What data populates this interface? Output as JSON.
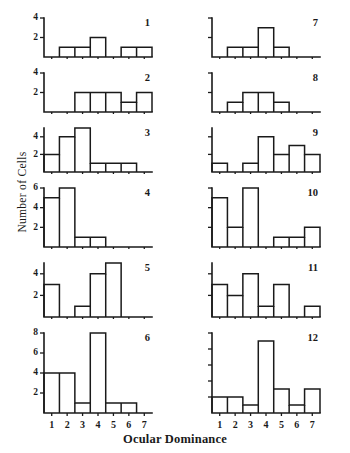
{
  "figure": {
    "xlabel": "Ocular Dominance",
    "ylabel": "Number of Cells",
    "x_tick_labels": [
      "1",
      "2",
      "3",
      "4",
      "5",
      "6",
      "7"
    ]
  },
  "chart_data": {
    "type": "bar",
    "title": "",
    "subtitle": "",
    "xlabel": "Ocular Dominance",
    "ylabel": "Number of Cells",
    "categories": [
      "1",
      "2",
      "3",
      "4",
      "5",
      "6",
      "7"
    ],
    "grid": false,
    "legend": "none",
    "layout": "2 columns x 6 rows of histogram panels",
    "panels": [
      {
        "label": "1",
        "column": "left",
        "row": 1,
        "values": [
          0,
          1,
          1,
          2,
          0,
          1,
          1
        ],
        "ylim": [
          0,
          4
        ],
        "yticks": [
          2,
          4
        ],
        "ytick_labels": [
          "2",
          "4"
        ]
      },
      {
        "label": "2",
        "column": "left",
        "row": 2,
        "values": [
          0,
          0,
          2,
          2,
          2,
          1,
          2
        ],
        "ylim": [
          0,
          4
        ],
        "yticks": [
          2,
          4
        ],
        "ytick_labels": [
          "2",
          "4"
        ]
      },
      {
        "label": "3",
        "column": "left",
        "row": 3,
        "values": [
          2,
          4,
          5,
          1,
          1,
          1,
          0
        ],
        "ylim": [
          0,
          5
        ],
        "yticks": [
          2,
          4
        ],
        "ytick_labels": [
          "2",
          "4"
        ]
      },
      {
        "label": "4",
        "column": "left",
        "row": 4,
        "values": [
          5,
          6,
          1,
          1,
          0,
          0,
          0
        ],
        "ylim": [
          0,
          6
        ],
        "yticks": [
          2,
          4,
          6
        ],
        "ytick_labels": [
          "2",
          "4",
          "6"
        ]
      },
      {
        "label": "5",
        "column": "left",
        "row": 5,
        "values": [
          3,
          0,
          1,
          4,
          5,
          0,
          0
        ],
        "ylim": [
          0,
          5
        ],
        "yticks": [
          2,
          4
        ],
        "ytick_labels": [
          "2",
          "4"
        ]
      },
      {
        "label": "6",
        "column": "left",
        "row": 6,
        "values": [
          4,
          4,
          1,
          8,
          1,
          1,
          0
        ],
        "ylim": [
          0,
          8
        ],
        "yticks": [
          2,
          4,
          6,
          8
        ],
        "ytick_labels": [
          "2",
          "4",
          "6",
          "8"
        ]
      },
      {
        "label": "7",
        "column": "right",
        "row": 1,
        "values": [
          0,
          1,
          1,
          3,
          1,
          0,
          0
        ],
        "ylim": [
          0,
          4
        ],
        "yticks": [
          2,
          4
        ],
        "ytick_labels": [
          "",
          ""
        ]
      },
      {
        "label": "8",
        "column": "right",
        "row": 2,
        "values": [
          0,
          1,
          2,
          2,
          1,
          0,
          0
        ],
        "ylim": [
          0,
          4
        ],
        "yticks": [
          2,
          4
        ],
        "ytick_labels": [
          "",
          ""
        ]
      },
      {
        "label": "9",
        "column": "right",
        "row": 3,
        "values": [
          1,
          0,
          1,
          4,
          2,
          3,
          2
        ],
        "ylim": [
          0,
          5
        ],
        "yticks": [
          2,
          4
        ],
        "ytick_labels": [
          "",
          ""
        ]
      },
      {
        "label": "10",
        "column": "right",
        "row": 4,
        "values": [
          5,
          2,
          6,
          0,
          1,
          1,
          2
        ],
        "ylim": [
          0,
          6
        ],
        "yticks": [
          2,
          4,
          6
        ],
        "ytick_labels": [
          "",
          "",
          ""
        ]
      },
      {
        "label": "11",
        "column": "right",
        "row": 5,
        "values": [
          3,
          2,
          4,
          1,
          3,
          0,
          1
        ],
        "ylim": [
          0,
          5
        ],
        "yticks": [
          2,
          4
        ],
        "ytick_labels": [
          "",
          ""
        ]
      },
      {
        "label": "12",
        "column": "right",
        "row": 6,
        "values": [
          2,
          2,
          1,
          9,
          3,
          1,
          3
        ],
        "ylim": [
          0,
          10
        ],
        "yticks": [
          2,
          4,
          6,
          8,
          10
        ],
        "ytick_labels": [
          "",
          "",
          "",
          "",
          ""
        ]
      }
    ]
  }
}
